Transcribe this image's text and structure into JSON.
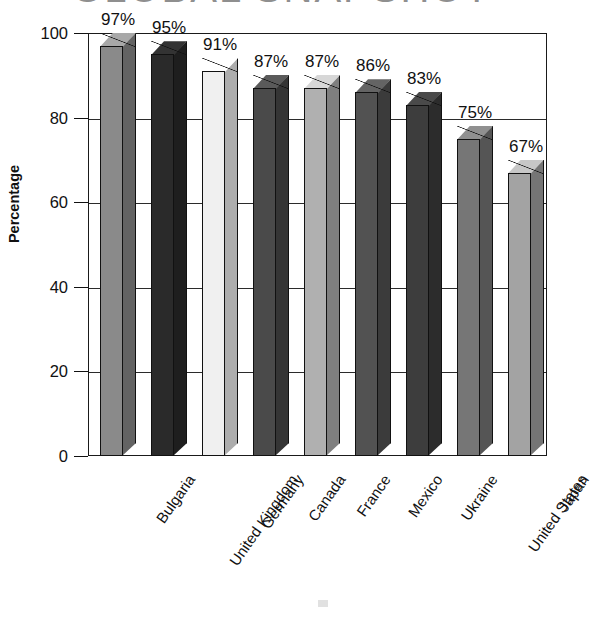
{
  "chart_data": {
    "type": "bar",
    "title": "GLOBAL SNAPSHOT",
    "xlabel": "",
    "ylabel": "Percentage",
    "ylim": [
      0,
      100
    ],
    "yticks": [
      0,
      20,
      40,
      60,
      80,
      100
    ],
    "ytick_labels": [
      "0",
      "20",
      "40",
      "60",
      "80",
      "100"
    ],
    "grid": true,
    "legend": "none",
    "categories": [
      "Bulgaria",
      "United Kingdom",
      "Germany",
      "Canada",
      "France",
      "Mexico",
      "Ukraine",
      "United States",
      "Japan"
    ],
    "values": [
      97,
      95,
      91,
      87,
      87,
      86,
      83,
      75,
      67
    ],
    "value_labels": [
      "97%",
      "95%",
      "91%",
      "87%",
      "87%",
      "86%",
      "83%",
      "75%",
      "67%"
    ],
    "bar_colors": [
      "#8a8a8a",
      "#2a2a2a",
      "#f0f0f0",
      "#4a4a4a",
      "#b0b0b0",
      "#525252",
      "#3d3d3d",
      "#767676",
      "#a3a3a3"
    ]
  }
}
